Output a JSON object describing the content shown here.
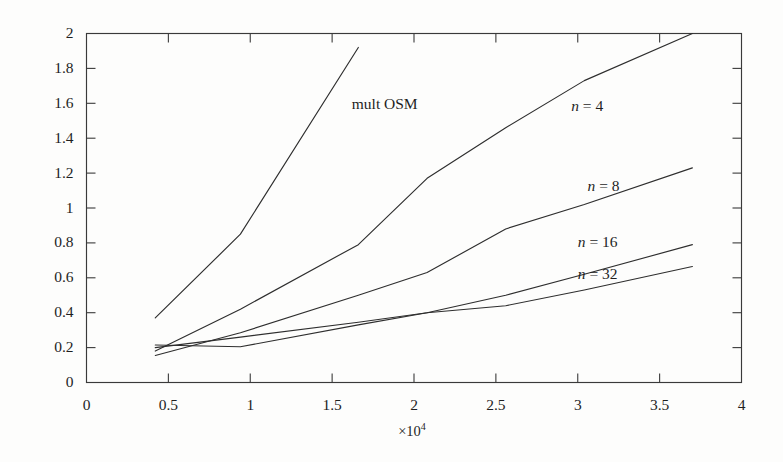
{
  "chart_data": {
    "type": "line",
    "title": "",
    "subtitle": "",
    "xlabel": "×10⁴",
    "ylabel": "",
    "xlim": [
      0,
      40000
    ],
    "ylim": [
      0,
      2
    ],
    "x_multiplier": "×10",
    "x_multiplier_exponent": "4",
    "grid": false,
    "legend_position": "inline-annotations",
    "xticks": [
      0,
      5000,
      10000,
      15000,
      20000,
      25000,
      30000,
      35000,
      40000
    ],
    "xtick_labels": [
      "0",
      "0.5",
      "1",
      "1.5",
      "2",
      "2.5",
      "3",
      "3.5",
      "4"
    ],
    "yticks": [
      0,
      0.2,
      0.4,
      0.6,
      0.8,
      1,
      1.2,
      1.4,
      1.6,
      1.8,
      2
    ],
    "ytick_labels": [
      "0",
      "0.2",
      "0.4",
      "0.6",
      "0.8",
      "1",
      "1.2",
      "1.4",
      "1.6",
      "1.8",
      "2"
    ],
    "series": [
      {
        "name": "mult OSM",
        "label": "mult OSM",
        "color": "#2e2e2e",
        "x": [
          4200,
          9400,
          16600
        ],
        "y": [
          0.37,
          0.85,
          1.92
        ]
      },
      {
        "name": "n = 4",
        "label": "n = 4",
        "label_prefix": "n",
        "label_value": "4",
        "color": "#2e2e2e",
        "x": [
          4200,
          9400,
          16600,
          20800,
          25600,
          30400,
          37000
        ],
        "y": [
          0.18,
          0.42,
          0.79,
          1.17,
          1.46,
          1.73,
          2.0
        ]
      },
      {
        "name": "n = 8",
        "label": "n = 8",
        "label_prefix": "n",
        "label_value": "8",
        "color": "#2e2e2e",
        "x": [
          4200,
          9400,
          16600,
          20800,
          25600,
          30400,
          37000
        ],
        "y": [
          0.155,
          0.285,
          0.5,
          0.63,
          0.88,
          1.02,
          1.23
        ]
      },
      {
        "name": "n = 16",
        "label": "n = 16",
        "label_prefix": "n",
        "label_value": "16",
        "color": "#2e2e2e",
        "x": [
          4200,
          9400,
          16600,
          20800,
          25600,
          30400,
          37000
        ],
        "y": [
          0.2,
          0.26,
          0.345,
          0.4,
          0.5,
          0.62,
          0.79
        ]
      },
      {
        "name": "n = 32",
        "label": "n = 32",
        "label_prefix": "n",
        "label_value": "32",
        "color": "#2e2e2e",
        "x": [
          4200,
          9400,
          16600,
          20800,
          25600,
          30400,
          37000
        ],
        "y": [
          0.215,
          0.205,
          0.33,
          0.4,
          0.44,
          0.53,
          0.665
        ]
      }
    ],
    "annotations": [
      {
        "text": "mult OSM",
        "x": 16200,
        "y": 1.565,
        "italic_prefix": false
      },
      {
        "text": "n = 4",
        "x": 29600,
        "y": 1.555,
        "italic_prefix": true
      },
      {
        "text": "n = 8",
        "x": 30600,
        "y": 1.095,
        "italic_prefix": true
      },
      {
        "text": "n = 16",
        "x": 30000,
        "y": 0.775,
        "italic_prefix": true
      },
      {
        "text": "n = 32",
        "x": 30000,
        "y": 0.595,
        "italic_prefix": true
      }
    ]
  },
  "axis": {
    "x_multiplier_base": "×10",
    "x_multiplier_exp": "4"
  }
}
